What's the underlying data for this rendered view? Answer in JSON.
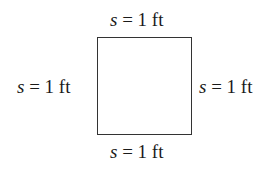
{
  "diagram": {
    "shape": "square",
    "labels": {
      "top": {
        "var": "s",
        "rest": " = 1 ft"
      },
      "bottom": {
        "var": "s",
        "rest": " = 1 ft"
      },
      "left": {
        "var": "s",
        "rest": " = 1 ft"
      },
      "right": {
        "var": "s",
        "rest": " = 1 ft"
      }
    }
  }
}
